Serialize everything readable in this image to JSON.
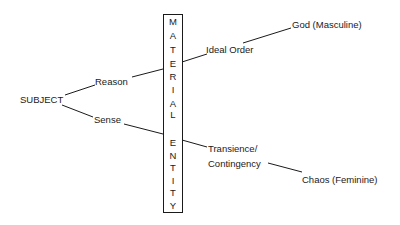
{
  "diagram": {
    "type": "concept-diagram",
    "nodes": {
      "subject": "SUBJECT",
      "reason": "Reason",
      "sense": "Sense",
      "ideal_order": "Ideal Order",
      "god": "God (Masculine)",
      "transience_line1": "Transience/",
      "transience_line2": "Contingency",
      "chaos": "Chaos (Feminine)"
    },
    "central_box": {
      "label": "MATERIAL ENTITY",
      "letters": [
        "M",
        "A",
        "T",
        "E",
        "R",
        "I",
        "A",
        "L",
        "E",
        "N",
        "T",
        "I",
        "T",
        "Y"
      ]
    },
    "edges": [
      {
        "from": "SUBJECT",
        "to": "Reason"
      },
      {
        "from": "SUBJECT",
        "to": "Sense"
      },
      {
        "from": "Reason",
        "to": "MATERIAL ENTITY"
      },
      {
        "from": "Sense",
        "to": "MATERIAL ENTITY"
      },
      {
        "from": "MATERIAL ENTITY",
        "to": "Ideal Order"
      },
      {
        "from": "Ideal Order",
        "to": "God (Masculine)"
      },
      {
        "from": "MATERIAL ENTITY",
        "to": "Transience/Contingency"
      },
      {
        "from": "Transience/Contingency",
        "to": "Chaos (Feminine)"
      }
    ],
    "colors": {
      "line": "#1a1a1a",
      "text": "#1a1a1a",
      "background": "#ffffff"
    }
  }
}
